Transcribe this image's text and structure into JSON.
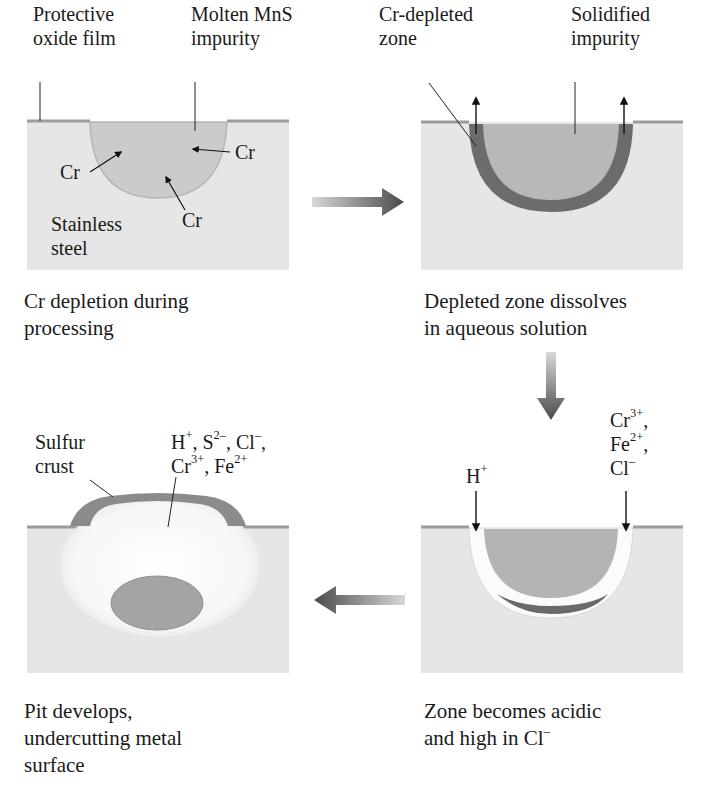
{
  "diagram": {
    "type": "process",
    "topic": "Pitting corrosion of stainless steel at MnS inclusion",
    "colors": {
      "steel": "#e6e6e6",
      "oxide_film": "#9c9c9c",
      "impurity": "#c9c9c9",
      "depleted_zone": "#6f6f6f",
      "arrow": "#555555",
      "pit": "#fafafa",
      "crust": "#8a8a8a"
    },
    "panels": [
      {
        "id": "step-1",
        "labels": {
          "film_line1": "Protective",
          "film_line2": "oxide film",
          "impurity_line1": "Molten MnS",
          "impurity_line2": "impurity",
          "cr_left": "Cr",
          "cr_right": "Cr",
          "cr_bottom": "Cr",
          "steel_line1": "Stainless",
          "steel_line2": "steel"
        },
        "caption_line1": "Cr depletion during",
        "caption_line2": "processing"
      },
      {
        "id": "step-2",
        "labels": {
          "zone_line1": "Cr-depleted",
          "zone_line2": "zone",
          "solid_line1": "Solidified",
          "solid_line2": "impurity"
        },
        "caption_line1": "Depleted zone dissolves",
        "caption_line2": "in aqueous solution"
      },
      {
        "id": "step-3",
        "labels": {
          "h_ion": "H",
          "h_charge": "+",
          "cr_ion": "Cr",
          "cr_charge": "3+",
          "fe_ion": "Fe",
          "fe_charge": "2+",
          "cl_ion": "Cl",
          "cl_charge": "–",
          "comma": ","
        },
        "caption_line1": "Zone becomes acidic",
        "caption_line2": "and high in Cl",
        "caption_charge": "–"
      },
      {
        "id": "step-4",
        "labels": {
          "crust_line1": "Sulfur",
          "crust_line2": "crust",
          "h": "H",
          "h_c": "+",
          "s": "S",
          "s_c": "2–",
          "cl": "Cl",
          "cl_c": "–",
          "cr": "Cr",
          "cr_c": "3+",
          "fe": "Fe",
          "fe_c": "2+",
          "sep": ", "
        },
        "caption_line1": "Pit develops,",
        "caption_line2": "undercutting metal",
        "caption_line3": "surface"
      }
    ],
    "flow": [
      "step-1 → step-2",
      "step-2 → step-3",
      "step-3 → step-4"
    ]
  }
}
